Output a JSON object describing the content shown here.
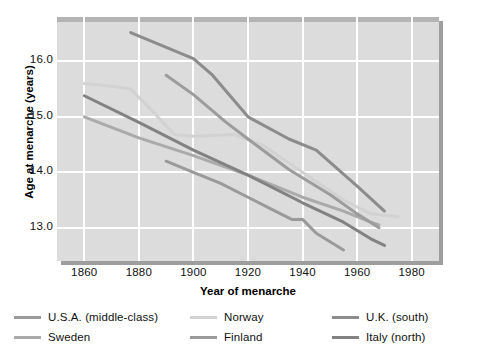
{
  "chart_data": {
    "type": "line",
    "title": "",
    "xlabel": "Year of menarche",
    "ylabel": "Age at menarche (years)",
    "xlim": [
      1850,
      1990
    ],
    "ylim": [
      12.4,
      16.8
    ],
    "xticks": [
      1860,
      1880,
      1900,
      1920,
      1940,
      1960,
      1980
    ],
    "yticks": [
      13.0,
      14.0,
      15.0,
      16.0
    ],
    "ytick_labels": [
      "13.0",
      "14.0",
      "15.0",
      "16.0"
    ],
    "xtick_labels": [
      "1860",
      "1880",
      "1900",
      "1920",
      "1940",
      "1960",
      "1980"
    ],
    "grid": true,
    "grid_color": "#ffffff",
    "plot_background": "#dcdcdc",
    "legend_position": "below",
    "series": [
      {
        "name": "U.S.A. (middle-class)",
        "color": "#9a9a9a",
        "x": [
          1890,
          1900,
          1910,
          1920,
          1930,
          1936,
          1940,
          1945,
          1955
        ],
        "y": [
          14.2,
          14.0,
          13.8,
          13.55,
          13.3,
          13.15,
          13.15,
          12.9,
          12.6
        ]
      },
      {
        "name": "Norway",
        "color": "#d2d2d2",
        "x": [
          1860,
          1870,
          1877,
          1885,
          1893,
          1900,
          1915,
          1925,
          1940,
          1955,
          1965,
          1975
        ],
        "y": [
          15.6,
          15.55,
          15.5,
          15.1,
          14.68,
          14.65,
          14.68,
          14.5,
          14.0,
          13.5,
          13.25,
          13.2
        ]
      },
      {
        "name": "U.K. (south)",
        "color": "#8c8c8c",
        "x": [
          1877,
          1900,
          1907,
          1920,
          1935,
          1945,
          1960,
          1970
        ],
        "y": [
          16.52,
          16.05,
          15.75,
          15.0,
          14.6,
          14.4,
          13.75,
          13.3
        ]
      },
      {
        "name": "Sweden",
        "color": "#aaaaaa",
        "x": [
          1860,
          1880,
          1900,
          1920,
          1940,
          1955,
          1965,
          1968
        ],
        "y": [
          15.0,
          14.62,
          14.3,
          13.95,
          13.55,
          13.3,
          13.1,
          13.05
        ]
      },
      {
        "name": "Finland",
        "color": "#9c9c9c",
        "x": [
          1890,
          1900,
          1912,
          1920,
          1935,
          1950,
          1960,
          1968
        ],
        "y": [
          15.75,
          15.4,
          14.9,
          14.6,
          14.05,
          13.6,
          13.25,
          13.0
        ]
      },
      {
        "name": "Italy (north)",
        "color": "#828282",
        "x": [
          1860,
          1880,
          1900,
          1920,
          1940,
          1955,
          1965,
          1970
        ],
        "y": [
          15.38,
          14.9,
          14.4,
          13.95,
          13.45,
          13.1,
          12.8,
          12.68
        ]
      }
    ]
  },
  "axis": {
    "ylabel": "Age at menarche (years)",
    "xlabel": "Year of menarche"
  },
  "legend": {
    "items": [
      {
        "label": "U.S.A. (middle-class)",
        "color": "#9a9a9a"
      },
      {
        "label": "Norway",
        "color": "#d2d2d2"
      },
      {
        "label": "U.K. (south)",
        "color": "#8c8c8c"
      },
      {
        "label": "Sweden",
        "color": "#aaaaaa"
      },
      {
        "label": "Finland",
        "color": "#9c9c9c"
      },
      {
        "label": "Italy (north)",
        "color": "#828282"
      }
    ]
  }
}
